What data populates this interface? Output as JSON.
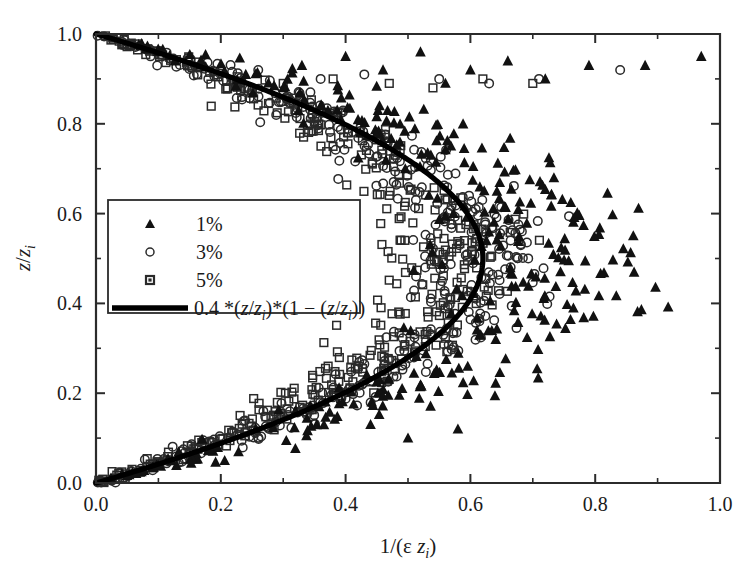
{
  "figure": {
    "background_color": "#ffffff",
    "foreground_color": "#1a1a1a"
  },
  "axes": {
    "x_title_parts": {
      "prefix": "1/(",
      "epsilon": "ε ",
      "z": "z",
      "sub": "i",
      "suffix": ")"
    },
    "y_title_parts": {
      "z1": "z",
      "slash": "/",
      "z2": "z",
      "sub": "i"
    },
    "x_ticks": [
      "0.0",
      "0.2",
      "0.4",
      "0.6",
      "0.8",
      "1.0"
    ],
    "y_ticks": [
      "0.0",
      "0.2",
      "0.4",
      "0.6",
      "0.8",
      "1.0"
    ],
    "x_tick_values": [
      0.0,
      0.2,
      0.4,
      0.6,
      0.8,
      1.0
    ],
    "y_tick_values": [
      0.0,
      0.2,
      0.4,
      0.6,
      0.8,
      1.0
    ],
    "x_minor_values": [
      0.1,
      0.3,
      0.5,
      0.7,
      0.9
    ],
    "y_minor_values": [
      0.1,
      0.3,
      0.5,
      0.7,
      0.9
    ],
    "xlim": [
      0.0,
      1.0
    ],
    "ylim": [
      0.0,
      1.0
    ],
    "grid": false,
    "tick_direction": "in"
  },
  "legend": {
    "position": "center-left",
    "entries": [
      {
        "marker": "filled-triangle",
        "label": "1%"
      },
      {
        "marker": "open-circle",
        "label": "3%"
      },
      {
        "marker": "small-square",
        "label": "5%"
      },
      {
        "marker": "thick-line",
        "label_parts": {
          "a": "0.4 *(",
          "z1": "z",
          "slash1": "/",
          "z2": "z",
          "sub1": "i",
          "b": ")*(1 − (",
          "z3": "z",
          "slash2": "/",
          "z4": "z",
          "sub2": "i",
          "c": "))"
        }
      }
    ]
  },
  "chart_data": {
    "type": "scatter",
    "title": "",
    "xlabel": "1/(ε z_i)",
    "ylabel": "z/z_i",
    "xlim": [
      0.0,
      1.0
    ],
    "ylim": [
      0.0,
      1.0
    ],
    "grid": false,
    "legend_position": "center-left",
    "series": [
      {
        "name": "1%",
        "marker": "filled-triangle",
        "color": "#111111",
        "n_points": 330,
        "description": "Filled triangles forming the outermost (right-most) arc of the parabolic cloud; scattered outliers near z/z_i = 0.9-0.95 extending to 1/(eps z_i) = 0.98",
        "arc_peak_x": 0.72,
        "spread": 0.075,
        "outliers": [
          [
            0.33,
            0.93
          ],
          [
            0.4,
            0.95
          ],
          [
            0.46,
            0.92
          ],
          [
            0.52,
            0.96
          ],
          [
            0.6,
            0.92
          ],
          [
            0.66,
            0.94
          ],
          [
            0.72,
            0.9
          ],
          [
            0.79,
            0.93
          ],
          [
            0.88,
            0.93
          ],
          [
            0.97,
            0.95
          ],
          [
            0.3,
            0.88
          ],
          [
            0.24,
            0.91
          ],
          [
            0.56,
            0.89
          ],
          [
            0.44,
            0.13
          ],
          [
            0.5,
            0.1
          ],
          [
            0.58,
            0.12
          ]
        ]
      },
      {
        "name": "3%",
        "marker": "open-circle",
        "color": "#2a2a2a",
        "n_points": 420,
        "description": "Open circles forming the middle arc of the parabolic cloud, tightly hugging the model curve",
        "arc_peak_x": 0.615,
        "spread": 0.045,
        "outliers": [
          [
            0.36,
            0.9
          ],
          [
            0.43,
            0.91
          ],
          [
            0.55,
            0.9
          ],
          [
            0.63,
            0.89
          ],
          [
            0.71,
            0.9
          ],
          [
            0.84,
            0.92
          ],
          [
            0.26,
            0.92
          ],
          [
            0.18,
            0.9
          ]
        ]
      },
      {
        "name": "5%",
        "marker": "open-square",
        "color": "#2a2a2a",
        "n_points": 400,
        "description": "Open squares forming the innermost (left-most) arc of the parabolic cloud",
        "arc_peak_x": 0.565,
        "spread": 0.045,
        "outliers": [
          [
            0.3,
            0.89
          ],
          [
            0.38,
            0.9
          ],
          [
            0.47,
            0.89
          ],
          [
            0.54,
            0.88
          ],
          [
            0.62,
            0.9
          ],
          [
            0.7,
            0.89
          ],
          [
            0.21,
            0.88
          ]
        ]
      }
    ],
    "model_curve": {
      "label": "0.4 *(z/z_i)*(1 − (z/z_i))",
      "color": "#000000",
      "linewidth": 5.2,
      "form": "x = 4 * A * t * (1 - t), t = z/z_i",
      "peak_x": 0.62,
      "peak_at_t": 0.5,
      "endpoints": [
        [
          0.0,
          0.0
        ],
        [
          0.0,
          1.0
        ]
      ]
    }
  }
}
